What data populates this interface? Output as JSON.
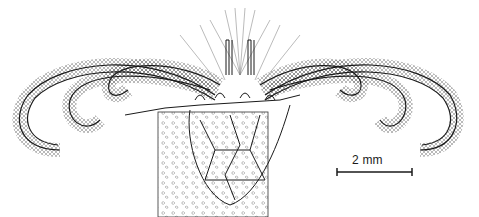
{
  "figure": {
    "type": "scientific-line-drawing",
    "ink_color": "#1a1a1a",
    "background": "#ffffff"
  },
  "scale_bar": {
    "label": "2 mm",
    "x1": 337,
    "x2": 412,
    "y": 172
  }
}
